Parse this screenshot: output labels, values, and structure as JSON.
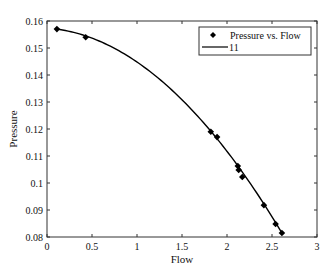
{
  "chart_data": {
    "type": "scatter",
    "title": "",
    "xlabel": "Flow",
    "ylabel": "Pressure",
    "xlim": [
      0,
      3
    ],
    "ylim": [
      0.08,
      0.16
    ],
    "xticks": [
      0,
      0.5,
      1,
      1.5,
      2,
      2.5,
      3
    ],
    "xtick_labels": [
      "0",
      "0.5",
      "1",
      "1.5",
      "2",
      "2.5",
      "3"
    ],
    "yticks": [
      0.08,
      0.09,
      0.1,
      0.11,
      0.12,
      0.13,
      0.14,
      0.15,
      0.16
    ],
    "ytick_labels": [
      "0.08",
      "0.09",
      "0.1",
      "0.11",
      "0.12",
      "0.13",
      "0.14",
      "0.15",
      "0.16"
    ],
    "grid": false,
    "legend_position": "upper right",
    "series": [
      {
        "name": "Pressure vs. Flow",
        "kind": "markers",
        "marker": "diamond",
        "color": "#000000",
        "x": [
          0.11,
          0.43,
          1.82,
          1.89,
          2.12,
          2.13,
          2.17,
          2.41,
          2.54,
          2.61
        ],
        "y": [
          0.157,
          0.154,
          0.119,
          0.117,
          0.1063,
          0.1048,
          0.1022,
          0.0918,
          0.0848,
          0.0815
        ]
      },
      {
        "name": "11",
        "kind": "line",
        "color": "#000000",
        "fit": {
          "model": "quadratic",
          "a": 0.15738,
          "b": -0.002333,
          "c": -0.010245
        },
        "x_range": [
          0.11,
          2.61
        ]
      }
    ]
  }
}
